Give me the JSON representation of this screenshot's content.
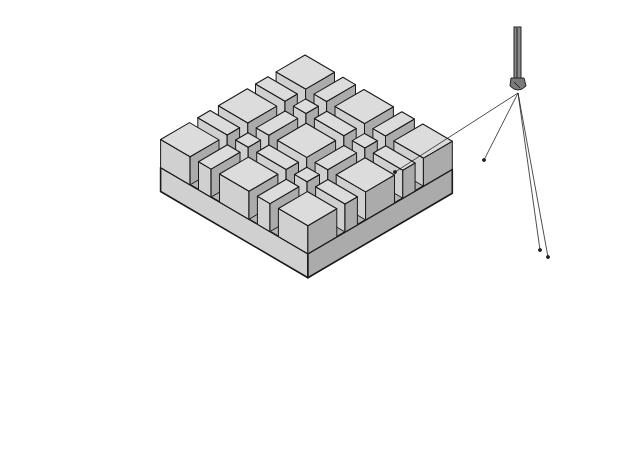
{
  "figure": {
    "colors": {
      "background": "#ffffff",
      "top_face": "#dcdcdc",
      "left_face": "#d0d0d0",
      "right_face": "#ababab",
      "groove_shadow": "#b4b4b4",
      "outline": "#1a1a1a"
    },
    "grid": {
      "cells_per_side": 5,
      "cell_sizes": [
        "large",
        "small",
        "large",
        "small",
        "large"
      ]
    },
    "tool": {
      "name": "router bit",
      "type": "core-box bit"
    },
    "callout": {
      "leader_count": 4,
      "target": "cove grooves"
    }
  }
}
